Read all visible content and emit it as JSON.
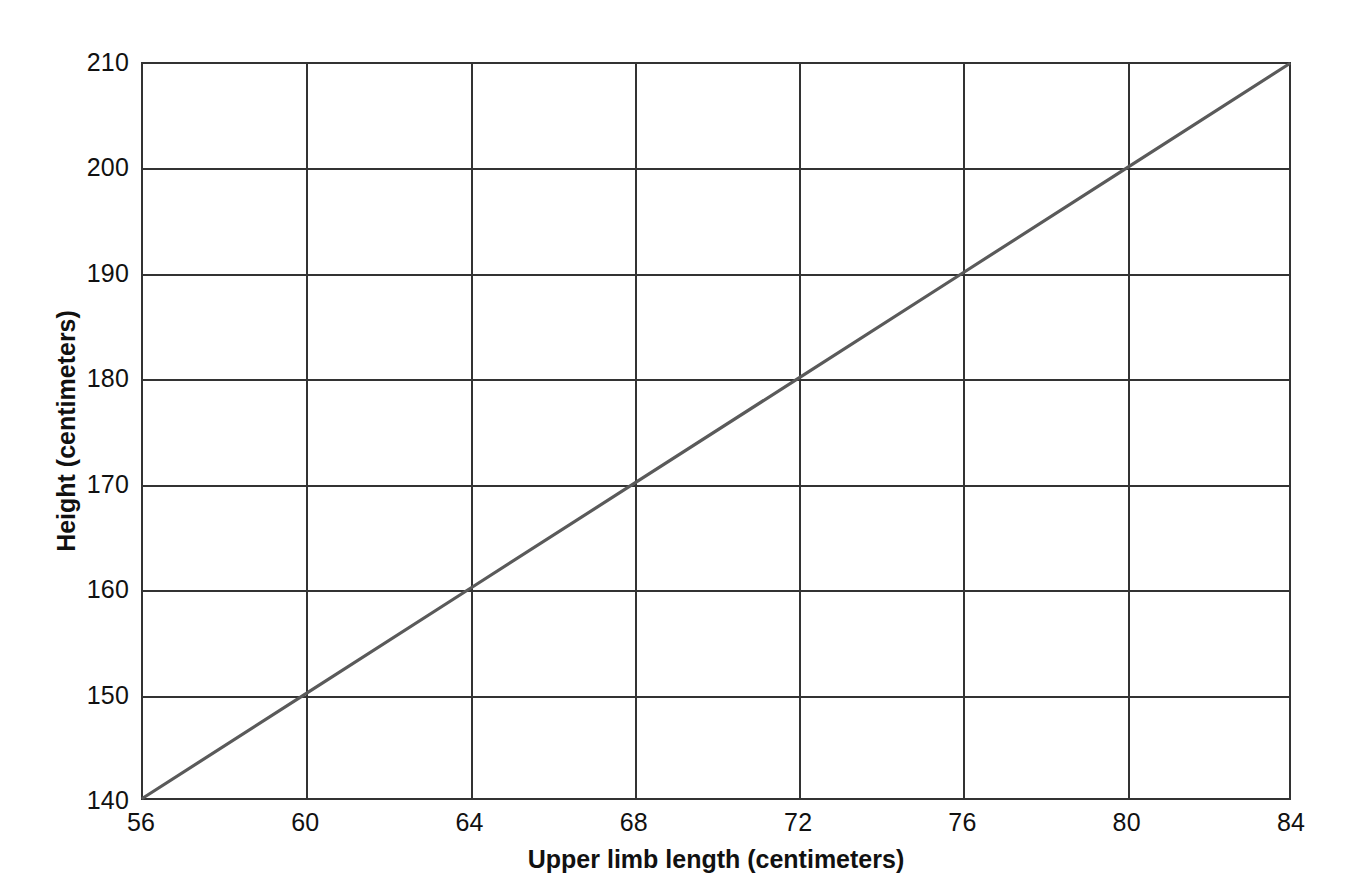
{
  "chart_data": {
    "type": "line",
    "title": "",
    "xlabel": "Upper limb length (centimeters)",
    "ylabel": "Height (centimeters)",
    "xlim": [
      56,
      84
    ],
    "ylim": [
      140,
      210
    ],
    "xticks": [
      56,
      60,
      64,
      68,
      72,
      76,
      80,
      84
    ],
    "yticks": [
      140,
      150,
      160,
      170,
      180,
      190,
      200,
      210
    ],
    "grid": true,
    "legend": "none",
    "series": [
      {
        "name": "height-vs-upper-limb-length",
        "color": "#5a5a5a",
        "x": [
          56,
          60,
          64,
          68,
          72,
          76,
          80,
          84
        ],
        "values": [
          140,
          150,
          160,
          170,
          180,
          190,
          200,
          210
        ]
      }
    ]
  },
  "axes": {
    "x_tick_labels": [
      "56",
      "60",
      "64",
      "68",
      "72",
      "76",
      "80",
      "84"
    ],
    "y_tick_labels": [
      "140",
      "150",
      "160",
      "170",
      "180",
      "190",
      "200",
      "210"
    ],
    "x_title": "Upper limb length (centimeters)",
    "y_title": "Height (centimeters)"
  },
  "colors": {
    "line": "#5a5a5a",
    "grid": "#333333",
    "axis": "#333333",
    "background": "#ffffff",
    "text": "#111111"
  }
}
